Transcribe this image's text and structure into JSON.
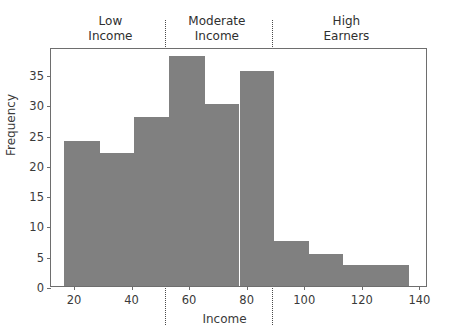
{
  "chart_data": {
    "type": "bar",
    "title": "",
    "xlabel": "Income",
    "ylabel": "Frequency",
    "xlim": [
      12,
      143
    ],
    "ylim": [
      0,
      39.5
    ],
    "grid": false,
    "legend": null,
    "bar_color": "#808080",
    "bin_edges": [
      16.5,
      29,
      41,
      53,
      65.5,
      77.5,
      89.5,
      101.5,
      113.5,
      136.5
    ],
    "categories": [
      "16.5-29",
      "29-41",
      "41-53",
      "53-65.5",
      "65.5-77.5",
      "77.5-89.5",
      "89.5-101.5",
      "101.5-113.5",
      "113.5-136.5"
    ],
    "values": [
      24,
      22,
      28,
      38,
      30,
      35.5,
      7.5,
      5.3,
      3.4
    ],
    "xticks": [
      20,
      40,
      60,
      80,
      100,
      120,
      140
    ],
    "xtick_labels": [
      "20",
      "40",
      "60",
      "80",
      "100",
      "120",
      "140"
    ],
    "yticks": [
      0,
      5,
      10,
      15,
      20,
      25,
      30,
      35
    ],
    "ytick_labels": [
      "0",
      "5",
      "10",
      "15",
      "20",
      "25",
      "30",
      "35"
    ],
    "annotations": [
      {
        "label_line1": "Low",
        "label_line2": "Income",
        "center_x": 33,
        "color": "#2f2f2f"
      },
      {
        "label_line1": "Moderate",
        "label_line2": "Income",
        "center_x": 70,
        "color": "#2f2f2f"
      },
      {
        "label_line1": "High",
        "label_line2": "Earners",
        "center_x": 115,
        "color": "#2f2f2f"
      }
    ],
    "dividers": [
      {
        "x": 52,
        "style": "dotted",
        "color": "#4a4a4a"
      },
      {
        "x": 89,
        "style": "dotted",
        "color": "#4a4a4a"
      }
    ]
  }
}
